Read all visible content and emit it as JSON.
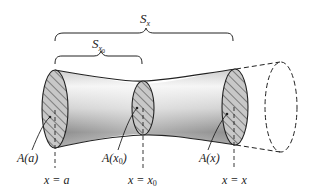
{
  "diagram": {
    "type": "solid-of-variable-cross-section",
    "braces": {
      "outer": {
        "label": "S",
        "subscript": "x"
      },
      "inner": {
        "label": "S",
        "subscript": "x",
        "subsub": "0"
      }
    },
    "cross_sections": [
      {
        "id": "a",
        "label_main": "A(",
        "label_var": "a",
        "label_sub": "",
        "label_close": ")",
        "position_main": "x = ",
        "position_var": "a",
        "position_sub": ""
      },
      {
        "id": "x0",
        "label_main": "A(",
        "label_var": "x",
        "label_sub": "0",
        "label_close": ")",
        "position_main": "x = ",
        "position_var": "x",
        "position_sub": "0"
      },
      {
        "id": "x",
        "label_main": "A(",
        "label_var": "x",
        "label_sub": "",
        "label_close": ")",
        "position_main": "x = ",
        "position_var": "x",
        "position_sub": ""
      }
    ],
    "colors": {
      "stroke": "#222222",
      "shade_dark": "#8a8a8a",
      "shade_light": "#f2f2f2",
      "hatch": "#333333",
      "background": "#ffffff"
    }
  }
}
